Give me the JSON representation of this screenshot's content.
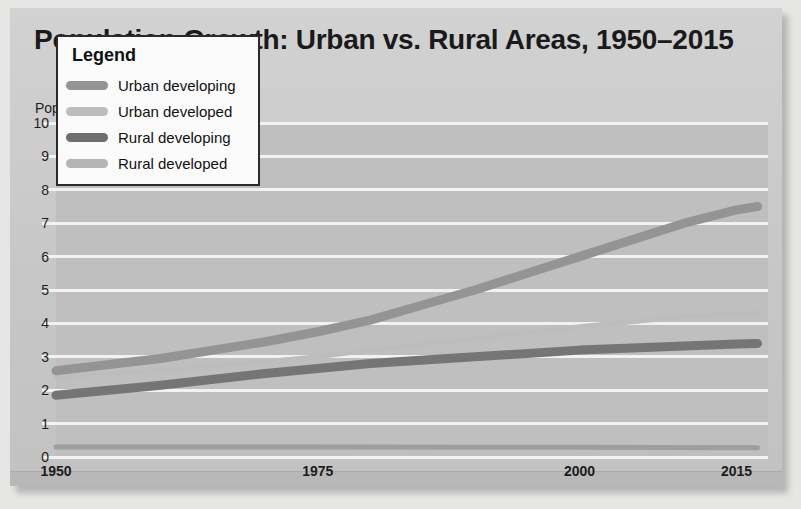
{
  "chart_data": {
    "type": "line",
    "title": "Population Growth: Urban vs. Rural Areas, 1950–2015",
    "ylabel": "Population (billions)",
    "xlabel": "",
    "xlim": [
      1950,
      2018
    ],
    "ylim": [
      0,
      10
    ],
    "y_ticks": [
      "10",
      "9",
      "8",
      "7",
      "6",
      "5",
      "4",
      "3",
      "2",
      "1",
      "0"
    ],
    "x_ticks": [
      "1950",
      "1975",
      "2000",
      "2015"
    ],
    "x_tick_values": [
      1950,
      1975,
      2000,
      2015
    ],
    "grid": true,
    "legend_position": "upper-left inside plot",
    "legend_title": "Legend",
    "x": [
      1950,
      1960,
      1970,
      1975,
      1980,
      1990,
      2000,
      2010,
      2015,
      2018
    ],
    "series": [
      {
        "name": "Urban developing",
        "color": "#8f8f8f",
        "values": [
          0.3,
          0.5,
          0.7,
          0.9,
          1.2,
          1.5,
          2.0,
          2.6,
          2.9,
          3.0
        ]
      },
      {
        "name": "Urban developed",
        "color": "#b3b3b3",
        "values": [
          0.4,
          0.5,
          0.7,
          0.8,
          0.9,
          0.9,
          0.9,
          0.9,
          1.0,
          1.0
        ]
      },
      {
        "name": "Rural developing",
        "color": "#6e6e6e",
        "values": [
          1.85,
          2.1,
          2.5,
          2.7,
          2.85,
          3.05,
          3.2,
          3.3,
          3.35,
          3.38
        ]
      },
      {
        "name": "Rural developed",
        "color": "#a8a8a8",
        "values": [
          0.3,
          0.3,
          0.3,
          0.3,
          0.3,
          0.28,
          0.27,
          0.26,
          0.25,
          0.25
        ]
      }
    ],
    "plotted_lines": [
      {
        "name": "Urban developing",
        "color": "#949494",
        "width": 9,
        "points": [
          [
            1950,
            2.58
          ],
          [
            1960,
            2.95
          ],
          [
            1970,
            3.45
          ],
          [
            1975,
            3.75
          ],
          [
            1980,
            4.1
          ],
          [
            1985,
            4.55
          ],
          [
            1990,
            5.0
          ],
          [
            1995,
            5.5
          ],
          [
            2000,
            6.0
          ],
          [
            2005,
            6.5
          ],
          [
            2010,
            7.0
          ],
          [
            2015,
            7.4
          ],
          [
            2017,
            7.5
          ]
        ]
      },
      {
        "name": "Urban developed",
        "color": "#bdbdbd",
        "width": 5,
        "points": [
          [
            1950,
            2.38
          ],
          [
            1960,
            2.6
          ],
          [
            1970,
            2.85
          ],
          [
            1975,
            3.0
          ],
          [
            1980,
            3.2
          ],
          [
            1990,
            3.55
          ],
          [
            2000,
            3.9
          ],
          [
            2010,
            4.2
          ],
          [
            2015,
            4.3
          ],
          [
            2017,
            4.32
          ]
        ]
      },
      {
        "name": "Rural developing",
        "color": "#757575",
        "width": 9,
        "points": [
          [
            1950,
            1.85
          ],
          [
            1960,
            2.15
          ],
          [
            1970,
            2.5
          ],
          [
            1975,
            2.65
          ],
          [
            1980,
            2.8
          ],
          [
            1990,
            3.0
          ],
          [
            2000,
            3.2
          ],
          [
            2010,
            3.32
          ],
          [
            2015,
            3.38
          ],
          [
            2017,
            3.4
          ]
        ]
      },
      {
        "name": "Rural developed",
        "color": "#9e9e9e",
        "width": 5,
        "points": [
          [
            1950,
            0.3
          ],
          [
            1975,
            0.3
          ],
          [
            2000,
            0.29
          ],
          [
            2015,
            0.28
          ],
          [
            2017,
            0.28
          ]
        ]
      }
    ],
    "legend_entries": [
      {
        "label": "Urban developing",
        "color": "#949494"
      },
      {
        "label": "Urban developed",
        "color": "#bdbdbd"
      },
      {
        "label": "Rural developing",
        "color": "#6f6f6f"
      },
      {
        "label": "Rural developed",
        "color": "#b5b5b5"
      }
    ]
  }
}
